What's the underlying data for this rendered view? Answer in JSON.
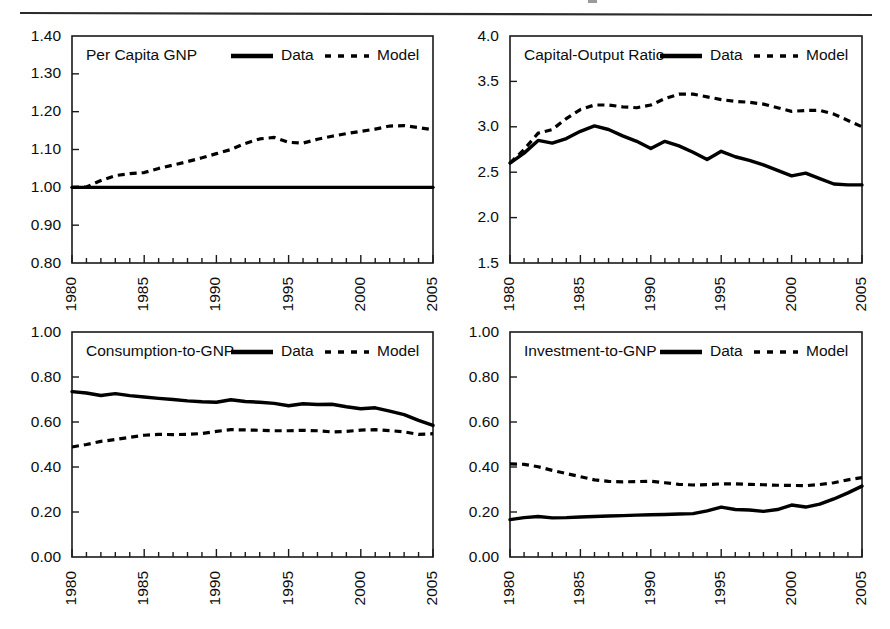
{
  "figure": {
    "header_rule": true,
    "background_color": "#ffffff",
    "ink_color": "#000000",
    "width": 890,
    "height": 629
  },
  "legend": {
    "data_label": "Data",
    "model_label": "Model",
    "data_style": "solid-thick",
    "model_style": "dashed"
  },
  "chart_data": [
    {
      "id": "per-capita-gnp",
      "type": "line",
      "title": "Per Capita GNP",
      "xlabel": "",
      "ylabel": "",
      "grid": false,
      "legend_position": "top-right-inside",
      "xlim": [
        1980,
        2005
      ],
      "ylim": [
        0.8,
        1.4
      ],
      "yticks": [
        "1.40",
        "1.30",
        "1.20",
        "1.10",
        "1.00",
        "0.90",
        "0.80"
      ],
      "ytick_values": [
        1.4,
        1.3,
        1.2,
        1.1,
        1.0,
        0.9,
        0.8
      ],
      "xticks": [
        "1980",
        "1985",
        "1990",
        "1995",
        "2000",
        "2005"
      ],
      "xtick_values": [
        1980,
        1985,
        1990,
        1995,
        2000,
        2005
      ],
      "x": [
        1980,
        1981,
        1982,
        1983,
        1984,
        1985,
        1986,
        1987,
        1988,
        1989,
        1990,
        1991,
        1992,
        1993,
        1994,
        1995,
        1996,
        1997,
        1998,
        1999,
        2000,
        2001,
        2002,
        2003,
        2004,
        2005
      ],
      "series": [
        {
          "name": "Data",
          "style": "solid",
          "values": [
            1.0,
            1.0,
            1.0,
            1.0,
            1.0,
            1.0,
            1.0,
            1.0,
            1.0,
            1.0,
            1.0,
            1.0,
            1.0,
            1.0,
            1.0,
            1.0,
            1.0,
            1.0,
            1.0,
            1.0,
            1.0,
            1.0,
            1.0,
            1.0,
            1.0,
            1.0
          ]
        },
        {
          "name": "Model",
          "style": "dashed",
          "values": [
            1.0,
            1.001,
            1.018,
            1.031,
            1.036,
            1.039,
            1.05,
            1.059,
            1.068,
            1.078,
            1.089,
            1.1,
            1.116,
            1.128,
            1.132,
            1.119,
            1.117,
            1.127,
            1.135,
            1.142,
            1.148,
            1.154,
            1.162,
            1.163,
            1.158,
            1.152
          ]
        }
      ]
    },
    {
      "id": "capital-output-ratio",
      "type": "line",
      "title": "Capital-Output Ratio",
      "xlabel": "",
      "ylabel": "",
      "grid": false,
      "legend_position": "top-right-inside",
      "xlim": [
        1980,
        2005
      ],
      "ylim": [
        1.5,
        4.0
      ],
      "yticks": [
        "4.0",
        "3.5",
        "3.0",
        "2.5",
        "2.0",
        "1.5"
      ],
      "ytick_values": [
        4.0,
        3.5,
        3.0,
        2.5,
        2.0,
        1.5
      ],
      "xticks": [
        "1980",
        "1985",
        "1990",
        "1995",
        "2000",
        "2005"
      ],
      "xtick_values": [
        1980,
        1985,
        1990,
        1995,
        2000,
        2005
      ],
      "x": [
        1980,
        1981,
        1982,
        1983,
        1984,
        1985,
        1986,
        1987,
        1988,
        1989,
        1990,
        1991,
        1992,
        1993,
        1994,
        1995,
        1996,
        1997,
        1998,
        1999,
        2000,
        2001,
        2002,
        2003,
        2004,
        2005
      ],
      "series": [
        {
          "name": "Data",
          "style": "solid",
          "values": [
            2.6,
            2.71,
            2.85,
            2.82,
            2.87,
            2.95,
            3.01,
            2.97,
            2.9,
            2.84,
            2.76,
            2.84,
            2.79,
            2.72,
            2.64,
            2.73,
            2.67,
            2.63,
            2.58,
            2.52,
            2.46,
            2.49,
            2.43,
            2.37,
            2.36,
            2.36
          ]
        },
        {
          "name": "Model",
          "style": "dashed",
          "values": [
            2.6,
            2.75,
            2.93,
            2.97,
            3.09,
            3.19,
            3.24,
            3.24,
            3.22,
            3.21,
            3.24,
            3.31,
            3.36,
            3.36,
            3.33,
            3.3,
            3.28,
            3.27,
            3.25,
            3.21,
            3.17,
            3.18,
            3.18,
            3.14,
            3.07,
            3.0
          ]
        }
      ]
    },
    {
      "id": "consumption-to-gnp",
      "type": "line",
      "title": "Consumption-to-GNP",
      "xlabel": "",
      "ylabel": "",
      "grid": false,
      "legend_position": "top-right-inside",
      "xlim": [
        1980,
        2005
      ],
      "ylim": [
        0.0,
        1.0
      ],
      "yticks": [
        "1.00",
        "0.80",
        "0.60",
        "0.40",
        "0.20",
        "0.00"
      ],
      "ytick_values": [
        1.0,
        0.8,
        0.6,
        0.4,
        0.2,
        0.0
      ],
      "xticks": [
        "1980",
        "1985",
        "1990",
        "1995",
        "2000",
        "2005"
      ],
      "xtick_values": [
        1980,
        1985,
        1990,
        1995,
        2000,
        2005
      ],
      "x": [
        1980,
        1981,
        1982,
        1983,
        1984,
        1985,
        1986,
        1987,
        1988,
        1989,
        1990,
        1991,
        1992,
        1993,
        1994,
        1995,
        1996,
        1997,
        1998,
        1999,
        2000,
        2001,
        2002,
        2003,
        2004,
        2005
      ],
      "series": [
        {
          "name": "Data",
          "style": "solid",
          "values": [
            0.735,
            0.729,
            0.718,
            0.726,
            0.717,
            0.711,
            0.705,
            0.7,
            0.694,
            0.69,
            0.688,
            0.699,
            0.691,
            0.688,
            0.683,
            0.672,
            0.681,
            0.678,
            0.679,
            0.668,
            0.659,
            0.663,
            0.648,
            0.633,
            0.607,
            0.585
          ]
        },
        {
          "name": "Model",
          "style": "dashed",
          "values": [
            0.489,
            0.5,
            0.514,
            0.522,
            0.532,
            0.541,
            0.545,
            0.544,
            0.545,
            0.549,
            0.558,
            0.566,
            0.565,
            0.563,
            0.561,
            0.561,
            0.563,
            0.561,
            0.556,
            0.558,
            0.564,
            0.566,
            0.562,
            0.556,
            0.545,
            0.548
          ]
        }
      ]
    },
    {
      "id": "investment-to-gnp",
      "type": "line",
      "title": "Investment-to-GNP",
      "xlabel": "",
      "ylabel": "",
      "grid": false,
      "legend_position": "top-right-inside",
      "xlim": [
        1980,
        2005
      ],
      "ylim": [
        0.0,
        1.0
      ],
      "yticks": [
        "1.00",
        "0.80",
        "0.60",
        "0.40",
        "0.20",
        "0.00"
      ],
      "ytick_values": [
        1.0,
        0.8,
        0.6,
        0.4,
        0.2,
        0.0
      ],
      "xticks": [
        "1980",
        "1985",
        "1990",
        "1995",
        "2000",
        "2005"
      ],
      "xtick_values": [
        1980,
        1985,
        1990,
        1995,
        2000,
        2005
      ],
      "x": [
        1980,
        1981,
        1982,
        1983,
        1984,
        1985,
        1986,
        1987,
        1988,
        1989,
        1990,
        1991,
        1992,
        1993,
        1994,
        1995,
        1996,
        1997,
        1998,
        1999,
        2000,
        2001,
        2002,
        2003,
        2004,
        2005
      ],
      "series": [
        {
          "name": "Data",
          "style": "solid",
          "values": [
            0.166,
            0.175,
            0.18,
            0.174,
            0.175,
            0.178,
            0.18,
            0.182,
            0.184,
            0.186,
            0.188,
            0.189,
            0.191,
            0.193,
            0.205,
            0.222,
            0.211,
            0.209,
            0.203,
            0.211,
            0.231,
            0.222,
            0.235,
            0.258,
            0.285,
            0.315
          ]
        },
        {
          "name": "Model",
          "style": "dashed",
          "values": [
            0.414,
            0.412,
            0.401,
            0.385,
            0.371,
            0.357,
            0.343,
            0.336,
            0.334,
            0.335,
            0.337,
            0.33,
            0.323,
            0.32,
            0.322,
            0.325,
            0.325,
            0.323,
            0.321,
            0.319,
            0.318,
            0.317,
            0.322,
            0.33,
            0.343,
            0.353
          ]
        }
      ]
    }
  ]
}
